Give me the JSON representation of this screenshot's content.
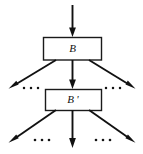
{
  "figure": {
    "type": "flow-diagram",
    "background_color": "#ffffff",
    "stroke_color": "#111111",
    "nodes": [
      {
        "id": "B",
        "label": "B",
        "x": 43,
        "y": 37,
        "width": 58,
        "height": 23
      },
      {
        "id": "Bprime",
        "label": "B '",
        "x": 45,
        "y": 89,
        "width": 56,
        "height": 21
      }
    ],
    "edges": [
      {
        "id": "input-arrow",
        "from": "top",
        "to": "B",
        "direction": "down",
        "x1": 72,
        "y1": 5,
        "x2": 72,
        "y2": 36
      },
      {
        "id": "b-left-branch",
        "from": "B",
        "to": "left-ellipsis",
        "direction": "down-left",
        "x1": 56,
        "y1": 60,
        "x2": 10,
        "y2": 88
      },
      {
        "id": "b-center-branch",
        "from": "B",
        "to": "Bprime",
        "direction": "down",
        "x1": 72,
        "y1": 60,
        "x2": 72,
        "y2": 88
      },
      {
        "id": "b-right-branch",
        "from": "B",
        "to": "right-ellipsis",
        "direction": "down-right",
        "x1": 88,
        "y1": 60,
        "x2": 134,
        "y2": 88
      },
      {
        "id": "bprime-left-branch",
        "from": "Bprime",
        "to": "bottom-left-ellipsis",
        "direction": "down-left",
        "x1": 56,
        "y1": 110,
        "x2": 10,
        "y2": 142
      },
      {
        "id": "bprime-center-branch",
        "from": "Bprime",
        "to": "bottom",
        "direction": "down",
        "x1": 72,
        "y1": 110,
        "x2": 72,
        "y2": 148
      },
      {
        "id": "bprime-right-branch",
        "from": "Bprime",
        "to": "bottom-right-ellipsis",
        "direction": "down-right",
        "x1": 88,
        "y1": 110,
        "x2": 134,
        "y2": 142
      }
    ],
    "ellipses": [
      {
        "id": "ellipsis-upper-left",
        "label": "• • •",
        "dots": 3,
        "cx": 31,
        "cy": 88
      },
      {
        "id": "ellipsis-upper-right",
        "label": "• • •",
        "dots": 3,
        "cx": 113,
        "cy": 88
      },
      {
        "id": "ellipsis-lower-left",
        "label": "• • •",
        "dots": 3,
        "cx": 42,
        "cy": 140
      },
      {
        "id": "ellipsis-lower-right",
        "label": "• • •",
        "dots": 3,
        "cx": 103,
        "cy": 140
      }
    ]
  }
}
